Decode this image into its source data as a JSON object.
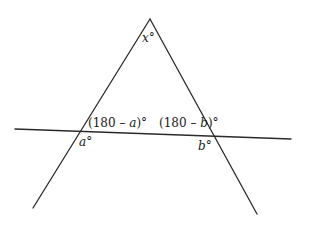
{
  "diagram": {
    "type": "geometry",
    "lines": [
      {
        "name": "left-side",
        "from": [
          150,
          19
        ],
        "to": [
          33,
          208
        ]
      },
      {
        "name": "right-side",
        "from": [
          150,
          19
        ],
        "to": [
          257,
          214
        ]
      },
      {
        "name": "transversal",
        "from": [
          15,
          129
        ],
        "to": [
          291,
          139
        ]
      }
    ],
    "points": {
      "apex": [
        150,
        19
      ],
      "left_intersection": [
        83,
        131
      ],
      "right_intersection": [
        213,
        136
      ]
    },
    "labels": {
      "apex_angle": {
        "var": "x",
        "suffix": "°"
      },
      "left_interior_angle": {
        "prefix": "(180 – ",
        "var": "a",
        "suffix": ")°"
      },
      "right_interior_angle": {
        "prefix": "(180 – ",
        "var": "b",
        "suffix": ")°"
      },
      "left_exterior_angle": {
        "var": "a",
        "suffix": "°"
      },
      "right_exterior_angle": {
        "var": "b",
        "suffix": "°"
      }
    },
    "colors": {
      "line": "#2a2a2a",
      "text": "#1a1a1a",
      "background": "#ffffff"
    }
  }
}
